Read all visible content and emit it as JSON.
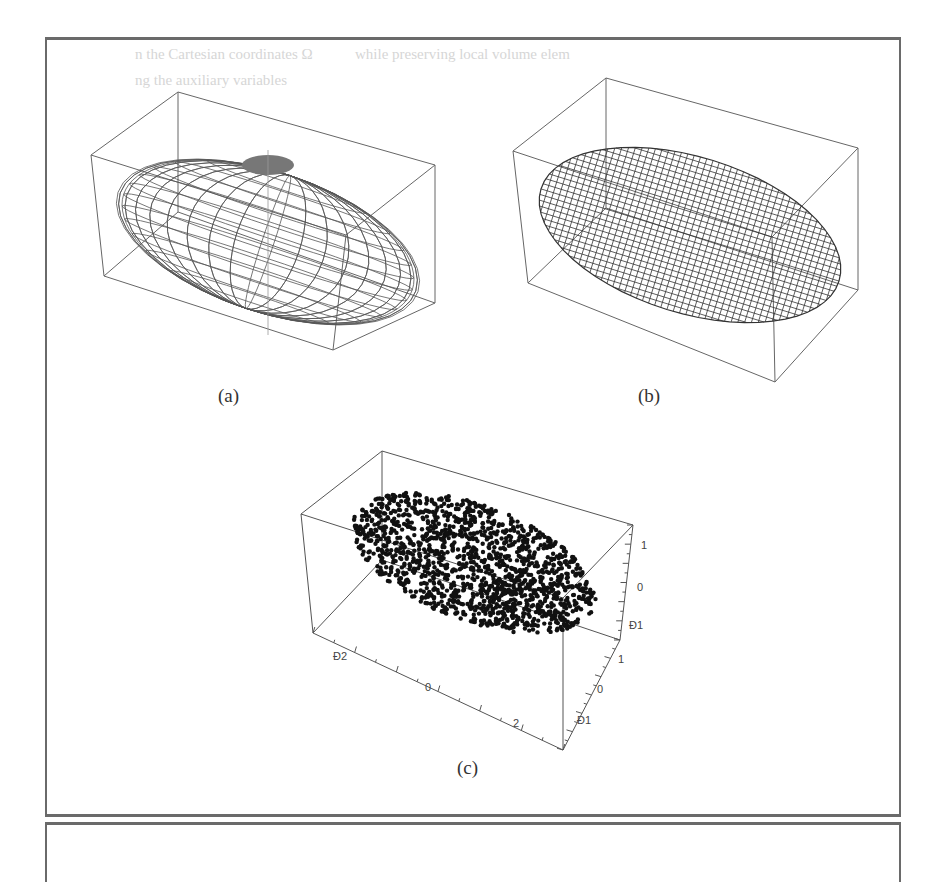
{
  "background_text": {
    "line1_left": "n the Cartesian coordinates Ω",
    "line1_right": "while preserving local volume elem",
    "line2": "ng the auxiliary variables"
  },
  "figures": [
    {
      "id": "a",
      "caption": "(a)",
      "kind": "wireframe-ellipsoid",
      "style": "latitude-longitude mesh"
    },
    {
      "id": "b",
      "caption": "(b)",
      "kind": "wireframe-ellipsoid",
      "style": "dense grid mesh"
    },
    {
      "id": "c",
      "caption": "(c)",
      "kind": "3d-scatter",
      "style": "point cloud within ellipsoid"
    }
  ],
  "chart_data": [
    {
      "type": "wireframe",
      "title": "(a)",
      "description": "Ellipsoid rendered as a latitude/longitude wireframe inside a 3D bounding box",
      "axes_labels": false
    },
    {
      "type": "wireframe",
      "title": "(b)",
      "description": "Ellipsoid rendered as a dense rectilinear grid wireframe inside a 3D bounding box",
      "axes_labels": false
    },
    {
      "type": "scatter",
      "title": "(c)",
      "description": "Approximately 1500 points uniformly filling an ellipsoid in 3D",
      "x_axis": {
        "tick_labels": [
          "Ð2",
          "0",
          "2"
        ],
        "range": [
          -3,
          3
        ]
      },
      "y_axis": {
        "tick_labels": [
          "1",
          "0",
          "Ð1"
        ],
        "range": [
          -1.5,
          1.5
        ]
      },
      "z_axis": {
        "tick_labels": [
          "1",
          "0",
          "Ð1"
        ],
        "range": [
          -1.5,
          1.5
        ]
      },
      "point_count_estimate": 1500,
      "marker": "filled circle",
      "marker_color": "#111111"
    }
  ],
  "colors": {
    "frame": "#6a6a6a",
    "box": "#666666",
    "mesh": "#444444",
    "points": "#111111"
  }
}
